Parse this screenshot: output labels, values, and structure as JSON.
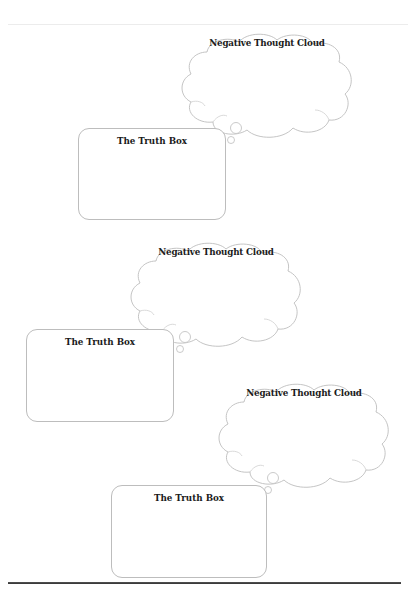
{
  "worksheet": {
    "pairs": [
      {
        "cloud_label": "Negative Thought Cloud",
        "box_title": "The Truth Box"
      },
      {
        "cloud_label": "Negative Thought Cloud",
        "box_title": "The Truth Box"
      },
      {
        "cloud_label": "Negative Thought Cloud",
        "box_title": "The Truth Box"
      }
    ]
  },
  "colors": {
    "outline": "#bdbdbd",
    "text": "#1a1a1a",
    "rule": "#333333"
  }
}
